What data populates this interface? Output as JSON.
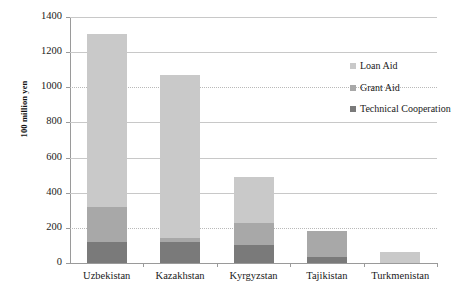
{
  "chart_data": {
    "type": "bar",
    "subtype": "stacked-bar",
    "title": "",
    "xlabel": "",
    "ylabel": "100 million yen",
    "ylim": [
      0,
      1400
    ],
    "ytick_step": 200,
    "yticks": [
      0,
      200,
      400,
      600,
      800,
      1000,
      1200,
      1400
    ],
    "grid": true,
    "legend_position": "right-inside",
    "categories": [
      "Uzbekistan",
      "Kazakhstan",
      "Kyrgyzstan",
      "Tajikistan",
      "Turkmenistan"
    ],
    "series": [
      {
        "name": "Technical Cooperation",
        "color": "#7a7a7a",
        "values": [
          120,
          120,
          100,
          35,
          0
        ]
      },
      {
        "name": "Grant Aid",
        "color": "#a8a8a8",
        "values": [
          200,
          20,
          130,
          145,
          0
        ]
      },
      {
        "name": "Loan Aid",
        "color": "#c9c9c9",
        "values": [
          985,
          930,
          260,
          0,
          60
        ]
      }
    ],
    "totals": [
      1305,
      1070,
      490,
      180,
      60
    ]
  },
  "legend": {
    "items": [
      {
        "label": "Loan Aid",
        "color": "#c9c9c9"
      },
      {
        "label": "Grant Aid",
        "color": "#a8a8a8"
      },
      {
        "label": "Technical Cooperation",
        "color": "#7a7a7a"
      }
    ]
  },
  "colors": {
    "loan_aid": "#c9c9c9",
    "grant_aid": "#a8a8a8",
    "technical_cooperation": "#7a7a7a",
    "gridline": "#c8c8c8",
    "axis": "#9a9a9a",
    "text": "#1a1a1a",
    "background": "#ffffff"
  }
}
